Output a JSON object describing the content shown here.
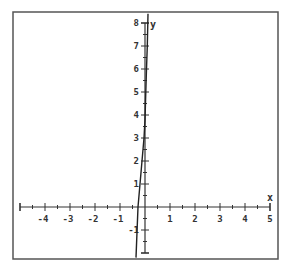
{
  "chart_data": {
    "type": "line",
    "title": "",
    "xlabel": "x",
    "ylabel": "y",
    "xlim": [
      -5,
      5
    ],
    "ylim": [
      -2,
      8
    ],
    "grid": false,
    "x_ticks": [
      -4,
      -3,
      -2,
      -1,
      1,
      2,
      3,
      4,
      5
    ],
    "y_ticks": [
      -1,
      1,
      2,
      3,
      4,
      5,
      6,
      7,
      8
    ],
    "x_minor_step": 0.5,
    "y_minor_step": 0.5,
    "series": [
      {
        "name": "curve",
        "color": "#222222",
        "x": [
          -0.36,
          -0.28,
          -0.2,
          -0.12,
          -0.04,
          0.0,
          0.03,
          0.06,
          0.09,
          0.12
        ],
        "y": [
          -2.2,
          0,
          1,
          2,
          3,
          3.8,
          5,
          6,
          7,
          8.4
        ]
      }
    ]
  },
  "layout": {
    "frame": {
      "left": 13,
      "top": 12,
      "right": 278,
      "bottom": 259
    },
    "origin_px": {
      "x": 145,
      "y": 207
    },
    "unit_px": {
      "x": 25,
      "y": 23
    },
    "axis_color": "#333333",
    "frame_color": "#555555"
  }
}
